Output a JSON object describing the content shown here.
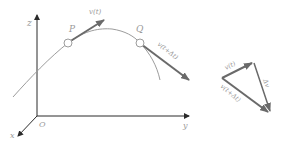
{
  "diagram": {
    "axes": {
      "z_label": "z",
      "y_label": "y",
      "x_label": "x",
      "origin_label": "O"
    },
    "points": {
      "p_label": "P",
      "q_label": "Q"
    },
    "vectors": {
      "v_t": "v(t)",
      "v_t_dt": "v(t+Δt)",
      "delta_v": "Δv"
    },
    "triangle": {
      "v_t": "v(t)",
      "v_t_dt": "v(t+Δt)",
      "delta_v": "Δv"
    },
    "colors": {
      "axis": "#2b2b2b",
      "curve": "#9c9c9c",
      "vector": "#6a6a6a",
      "label": "#9a9a9a"
    }
  }
}
